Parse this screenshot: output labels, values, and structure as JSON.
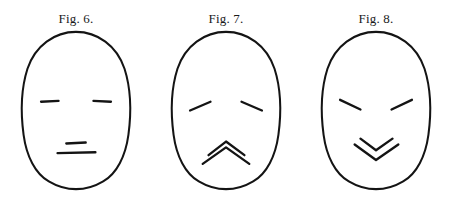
{
  "plate": {
    "background_color": "#ffffff",
    "ink_color": "#141414",
    "width": 457,
    "height": 201,
    "description": "Three schematic outline faces illustrating expressions"
  },
  "figures": [
    {
      "caption": "Fig. 6.",
      "expression": "neutral",
      "face_outline_name": "face-outline-neutral",
      "face_path": "M76 4 C 98 4, 118 18, 126 42 C 133 64, 133 88, 130 110 C 127 132, 118 150, 104 158 C 94 164, 84 166, 76 166 C 68 166, 58 164, 48 158 C 34 150, 25 132, 22 110 C 19 88, 19 64, 26 42 C 34 18, 54 4, 76 4 Z",
      "features": [
        {
          "name": "left-eyebrow",
          "path": "M40 76 L 58 75"
        },
        {
          "name": "right-eyebrow",
          "path": "M94 75 L 112 76"
        },
        {
          "name": "nose-stroke",
          "path": "M66 119 L 86 118"
        },
        {
          "name": "mouth-stroke",
          "path": "M57 129 L 96 128"
        }
      ]
    },
    {
      "caption": "Fig. 7.",
      "expression": "sad",
      "face_outline_name": "face-outline-sad",
      "face_path": "M76 4 C 98 4, 118 18, 126 42 C 133 64, 133 88, 130 110 C 127 132, 118 150, 104 158 C 94 164, 84 166, 76 166 C 68 166, 58 164, 48 158 C 34 150, 25 132, 22 110 C 19 88, 19 64, 26 42 C 34 18, 54 4, 76 4 Z",
      "features": [
        {
          "name": "left-eyebrow",
          "path": "M39 85 L 60 76"
        },
        {
          "name": "right-eyebrow",
          "path": "M92 76 L 113 85"
        },
        {
          "name": "mouth-upper-chevron",
          "path": "M58 131 L 76 117 L 95 131"
        },
        {
          "name": "mouth-lower-chevron",
          "path": "M52 140 L 76 123 L 100 140"
        }
      ]
    },
    {
      "caption": "Fig. 8.",
      "expression": "happy",
      "face_outline_name": "face-outline-happy",
      "face_path": "M76 4 C 98 4, 118 18, 126 42 C 133 64, 133 88, 130 110 C 127 132, 118 150, 104 158 C 94 164, 84 166, 76 166 C 68 166, 58 164, 48 158 C 34 150, 25 132, 22 110 C 19 88, 19 64, 26 42 C 34 18, 54 4, 76 4 Z",
      "features": [
        {
          "name": "left-eyebrow",
          "path": "M39 74 L 60 84"
        },
        {
          "name": "right-eyebrow",
          "path": "M92 84 L 113 74"
        },
        {
          "name": "mouth-upper-chevron",
          "path": "M60 114 L 76 126 L 93 114"
        },
        {
          "name": "mouth-lower-chevron",
          "path": "M54 120 L 76 136 L 99 120"
        }
      ]
    }
  ]
}
